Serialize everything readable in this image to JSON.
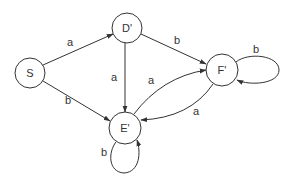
{
  "diagram": {
    "type": "state-transition-graph",
    "nodes": [
      {
        "id": "S",
        "label": "S",
        "cx": 30,
        "cy": 73,
        "r": 15
      },
      {
        "id": "D",
        "label": "D'",
        "cx": 127,
        "cy": 28,
        "r": 15
      },
      {
        "id": "E",
        "label": "E'",
        "cx": 125,
        "cy": 128,
        "r": 16
      },
      {
        "id": "F",
        "label": "F'",
        "cx": 222,
        "cy": 70,
        "r": 16
      }
    ],
    "edges": [
      {
        "from": "S",
        "to": "D",
        "label": "a",
        "label_x": 70,
        "label_y": 42
      },
      {
        "from": "S",
        "to": "E",
        "label": "b",
        "label_x": 68,
        "label_y": 100
      },
      {
        "from": "D",
        "to": "F",
        "label": "b",
        "label_x": 177,
        "label_y": 40
      },
      {
        "from": "D",
        "to": "E",
        "label": "a",
        "label_x": 114,
        "label_y": 77
      },
      {
        "from": "E",
        "to": "F",
        "label": "a",
        "label_x": 151,
        "label_y": 80
      },
      {
        "from": "F",
        "to": "E",
        "label": "a",
        "label_x": 196,
        "label_y": 111
      },
      {
        "from": "F",
        "to": "F",
        "label": "b",
        "label_x": 256,
        "label_y": 49
      },
      {
        "from": "E",
        "to": "E",
        "label": "b",
        "label_x": 104,
        "label_y": 152
      }
    ]
  }
}
